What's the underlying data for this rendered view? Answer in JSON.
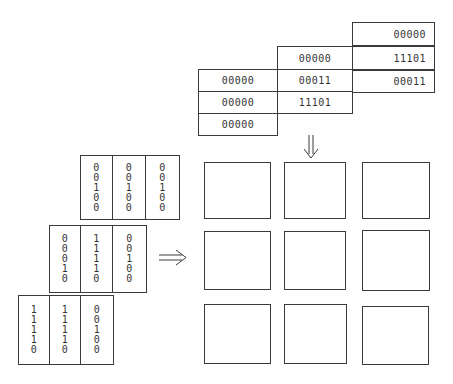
{
  "horizontal_matrix": {
    "description": "Staggered rows of 5-bit codes fed downward",
    "columns": [
      {
        "name": "left",
        "cells": [
          "00000",
          "00000",
          "00000"
        ]
      },
      {
        "name": "middle",
        "cells": [
          "00000",
          "00011",
          "11101"
        ]
      },
      {
        "name": "right",
        "cells": [
          "00000",
          "11101",
          "00011"
        ]
      }
    ]
  },
  "vertical_matrix": {
    "description": "Staggered rows of vertical 5-bit columns fed rightward",
    "rows": [
      {
        "name": "top",
        "columns": [
          [
            "0",
            "0",
            "1",
            "0",
            "0"
          ],
          [
            "0",
            "0",
            "1",
            "0",
            "0"
          ],
          [
            "0",
            "0",
            "1",
            "0",
            "0"
          ]
        ]
      },
      {
        "name": "middle",
        "columns": [
          [
            "0",
            "0",
            "0",
            "1",
            "0"
          ],
          [
            "1",
            "1",
            "1",
            "1",
            "0"
          ],
          [
            "0",
            "0",
            "1",
            "0",
            "0"
          ]
        ]
      },
      {
        "name": "bottom",
        "columns": [
          [
            "1",
            "1",
            "1",
            "1",
            "0"
          ],
          [
            "1",
            "1",
            "1",
            "1",
            "0"
          ],
          [
            "0",
            "0",
            "1",
            "0",
            "0"
          ]
        ]
      }
    ]
  },
  "arrows": {
    "down": "double-arrow-down",
    "right": "double-arrow-right"
  },
  "processor_grid": {
    "rows": 3,
    "cols": 3
  },
  "colors": {
    "line": "#3a3a3a",
    "background": "#ffffff",
    "text": "#333333"
  }
}
